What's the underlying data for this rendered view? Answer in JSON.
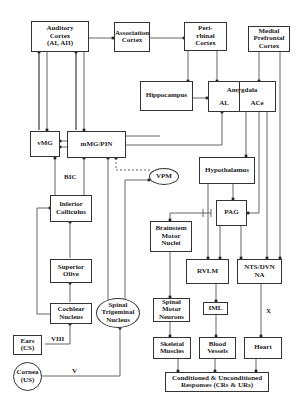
{
  "diagram": {
    "nodes": {
      "auditory_cortex": "Auditory\nCortex\n(AI, AII)",
      "association_cortex": "Association\nCortex",
      "perirhinal_cortex": "Peri-\nrhinal\nCortex",
      "medial_prefrontal_cortex": "Medial\nPrefrontal\nCortex",
      "hippocampus": "Hippocampus",
      "amygdala": "Amygdala",
      "amygdala_al": "AL",
      "amygdala_ace": "ACe",
      "vmg": "vMG",
      "mmg_pin": "mMG/PIN",
      "vpm": "VPM",
      "hypothalamus": "Hypothalamus",
      "inferior_colliculus": "Inferior\nColliculus",
      "pag": "PAG",
      "brainstem_motor_nuclei": "Brainstem\nMotor\nNuclei",
      "superior_olive": "Superior\nOlive",
      "rvlm": "RVLM",
      "nts_dvn_na": "NTS/DVN\nNA",
      "spinal_trigeminal_nucleus": "Spinal\nTrigeminal\nNucleus",
      "cochlear_nucleus": "Cochlear\nNucleus",
      "spinal_motor_neurons": "Spinal\nMotor\nNeurons",
      "iml": "IML",
      "ears_cs": "Ears\n(CS)",
      "skeletal_muscles": "Skeletal\nMuscles",
      "blood_vessels": "Blood\nVessels",
      "heart": "Heart",
      "cornea_us": "Cornea\n(US)",
      "responses": "Conditioned & Unconditioned\nResponses (CRs & URs)"
    },
    "labels": {
      "bic": "BIC",
      "viii": "VIII",
      "v": "V",
      "x": "X"
    },
    "edges": [
      {
        "from": "auditory_cortex",
        "to": "association_cortex"
      },
      {
        "from": "association_cortex",
        "to": "perirhinal_cortex"
      },
      {
        "from": "perirhinal_cortex",
        "to": "hippocampus"
      },
      {
        "from": "perirhinal_cortex",
        "to": "amygdala"
      },
      {
        "from": "medial_prefrontal_cortex",
        "to": "amygdala"
      },
      {
        "from": "hippocampus",
        "to": "amygdala"
      },
      {
        "from": "auditory_cortex",
        "to": "vmg",
        "bidirectional": true
      },
      {
        "from": "auditory_cortex",
        "to": "mmg_pin",
        "bidirectional": true
      },
      {
        "from": "mmg_pin",
        "to": "vmg"
      },
      {
        "from": "mmg_pin",
        "to": "amygdala"
      },
      {
        "from": "vmg",
        "to": "amygdala"
      },
      {
        "from": "amygdala",
        "to": "hypothalamus"
      },
      {
        "from": "amygdala",
        "to": "pag"
      },
      {
        "from": "amygdala",
        "to": "nts_dvn_na"
      },
      {
        "from": "medial_prefrontal_cortex",
        "to": "nts_dvn_na"
      },
      {
        "from": "hypothalamus",
        "to": "pag"
      },
      {
        "from": "hypothalamus",
        "to": "rvlm"
      },
      {
        "from": "pag",
        "to": "rvlm"
      },
      {
        "from": "pag",
        "to": "nts_dvn_na"
      },
      {
        "from": "pag",
        "to": "brainstem_motor_nuclei",
        "inhibitory": true
      },
      {
        "from": "vpm",
        "to": "mmg_pin",
        "dashed": true
      },
      {
        "from": "spinal_trigeminal_nucleus",
        "to": "vpm"
      },
      {
        "from": "spinal_trigeminal_nucleus",
        "to": "mmg_pin"
      },
      {
        "from": "inferior_colliculus",
        "to": "vmg",
        "label": "BIC"
      },
      {
        "from": "inferior_colliculus",
        "to": "mmg_pin"
      },
      {
        "from": "superior_olive",
        "to": "inferior_colliculus"
      },
      {
        "from": "cochlear_nucleus",
        "to": "superior_olive"
      },
      {
        "from": "cochlear_nucleus",
        "to": "inferior_colliculus"
      },
      {
        "from": "ears_cs",
        "to": "cochlear_nucleus",
        "label": "VIII"
      },
      {
        "from": "cornea_us",
        "to": "spinal_trigeminal_nucleus",
        "label": "V"
      },
      {
        "from": "brainstem_motor_nuclei",
        "to": "spinal_motor_neurons"
      },
      {
        "from": "spinal_motor_neurons",
        "to": "skeletal_muscles"
      },
      {
        "from": "rvlm",
        "to": "iml"
      },
      {
        "from": "iml",
        "to": "blood_vessels"
      },
      {
        "from": "nts_dvn_na",
        "to": "heart",
        "label": "X"
      },
      {
        "from": "skeletal_muscles",
        "to": "responses"
      },
      {
        "from": "blood_vessels",
        "to": "responses"
      },
      {
        "from": "heart",
        "to": "responses"
      }
    ]
  }
}
